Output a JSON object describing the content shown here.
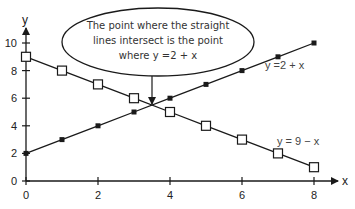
{
  "chart_data": {
    "type": "line",
    "title": "",
    "xlabel": "x",
    "ylabel": "y",
    "xlim": [
      0,
      8
    ],
    "ylim": [
      0,
      10
    ],
    "x_ticks": [
      0,
      2,
      4,
      6,
      8
    ],
    "y_ticks": [
      0,
      2,
      4,
      6,
      8,
      10
    ],
    "grid": false,
    "legend": "inline labels",
    "series": [
      {
        "name": "y = 2 + x",
        "label": "y =2 + x",
        "marker": "filled-square",
        "x": [
          0,
          1,
          2,
          3,
          4,
          5,
          6,
          7,
          8
        ],
        "values": [
          2,
          3,
          4,
          5,
          6,
          7,
          8,
          9,
          10
        ]
      },
      {
        "name": "y = 9 - x",
        "label": "y = 9 − x",
        "marker": "open-square",
        "x": [
          0,
          1,
          2,
          3,
          4,
          5,
          6,
          7,
          8
        ],
        "values": [
          9,
          8,
          7,
          6,
          5,
          4,
          3,
          2,
          1
        ]
      }
    ],
    "annotations": [
      {
        "type": "callout",
        "lines": [
          "The point where the straight",
          "lines intersect is the point",
          "where y =2 + x"
        ],
        "points_to": [
          3.5,
          5.5
        ]
      }
    ]
  },
  "colors": {
    "line": "#1a1a1a",
    "axis": "#1a1a1a",
    "text": "#222222",
    "background": "#ffffff"
  }
}
